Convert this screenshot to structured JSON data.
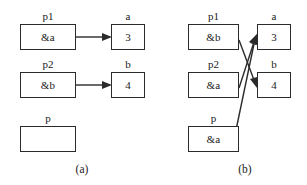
{
  "figure": {
    "background_color": "#ffffff",
    "stroke_color": "#2b2b2b",
    "panels": [
      {
        "id": "a",
        "caption": "(a)",
        "pointer_boxes": [
          {
            "label": "p1",
            "value": ""
          },
          {
            "label": "p2",
            "value": ""
          },
          {
            "label": "p",
            "value": ""
          }
        ],
        "value_boxes": [
          {
            "label": "a",
            "value": "3"
          },
          {
            "label": "b",
            "value": "4"
          }
        ],
        "pointer_values": [
          "&a",
          "&b",
          ""
        ],
        "arrows": [
          {
            "from": "p1",
            "to": "a"
          },
          {
            "from": "p2",
            "to": "b"
          }
        ]
      },
      {
        "id": "b",
        "caption": "(b)",
        "pointer_boxes": [
          {
            "label": "p1",
            "value": ""
          },
          {
            "label": "p2",
            "value": ""
          },
          {
            "label": "p",
            "value": ""
          }
        ],
        "value_boxes": [
          {
            "label": "a",
            "value": "3"
          },
          {
            "label": "b",
            "value": "4"
          }
        ],
        "pointer_values": [
          "&b",
          "&a",
          "&a"
        ],
        "arrows": [
          {
            "from": "p1",
            "to": "b"
          },
          {
            "from": "p2",
            "to": "a"
          },
          {
            "from": "p",
            "to": "a"
          }
        ]
      }
    ]
  },
  "panel_a": {
    "caption": "(a)",
    "p1_label": "p1",
    "p1_value": "&a",
    "p2_label": "p2",
    "p2_value": "&b",
    "p_label": "p",
    "p_value": "",
    "a_label": "a",
    "a_value": "3",
    "b_label": "b",
    "b_value": "4"
  },
  "panel_b": {
    "caption": "(b)",
    "p1_label": "p1",
    "p1_value": "&b",
    "p2_label": "p2",
    "p2_value": "&a",
    "p_label": "p",
    "p_value": "&a",
    "a_label": "a",
    "a_value": "3",
    "b_label": "b",
    "b_value": "4"
  }
}
